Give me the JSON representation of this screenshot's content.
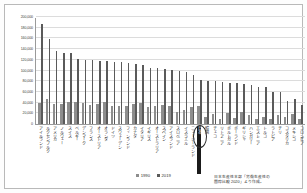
{
  "chart_data": {
    "type": "bar",
    "title": "",
    "subtitle": "",
    "xlabel": "",
    "ylabel": "",
    "ylim": [
      0,
      200000
    ],
    "yticks": [
      "0",
      "20,000",
      "40,000",
      "60,000",
      "80,000",
      "100,000",
      "120,000",
      "140,000",
      "160,000",
      "180,000",
      "200,000"
    ],
    "grid": true,
    "legend_position": "bottom-center",
    "highlight_category": "日本",
    "categories": [
      "アイルランド",
      "ルクセンブルク",
      "アメリカ",
      "ノルウェー",
      "スイス",
      "ベルギー",
      "デンマーク",
      "フランス",
      "オーストリア",
      "オランダ",
      "ドイツ",
      "スウェーデン",
      "フィンランド",
      "カナダ",
      "イタリア",
      "イギリス",
      "オーストラリア",
      "スペイン",
      "アイスランド",
      "スロベニア",
      "イスラエル",
      "ニュージーランド",
      "日本",
      "韓国",
      "チェコ",
      "リトアニア",
      "ポルトガル",
      "ポーランド",
      "ギリシャ",
      "ハンガリー",
      "エストニア",
      "トルコ",
      "ラトビア",
      "チリ",
      "コスタリカ",
      "メキシコ",
      "コロンビア"
    ],
    "series": [
      {
        "name": "1990",
        "color": "#8d8d8d",
        "values": [
          39000,
          47000,
          38000,
          37000,
          42000,
          41000,
          40000,
          36000,
          38000,
          41000,
          34000,
          34000,
          33000,
          37000,
          39000,
          31000,
          34000,
          35000,
          33000,
          22000,
          26000,
          31000,
          34000,
          14000,
          18000,
          10000,
          21000,
          11000,
          22000,
          17000,
          10000,
          14000,
          10000,
          16000,
          14000,
          18000,
          9000
        ]
      },
      {
        "name": "2019",
        "color": "#5a5a5a",
        "values": [
          187000,
          158000,
          136000,
          133000,
          132000,
          121000,
          120000,
          119000,
          118000,
          117000,
          116000,
          115000,
          114000,
          112000,
          111000,
          105000,
          104000,
          103000,
          101000,
          100000,
          98000,
          92000,
          82000,
          81000,
          80000,
          79000,
          77000,
          76000,
          75000,
          72000,
          70000,
          69000,
          59000,
          60000,
          43000,
          47000,
          36000
        ]
      }
    ],
    "annotations": [
      {
        "type": "ellipse",
        "target": "日本",
        "note": "Japan highlighted"
      }
    ]
  },
  "legend": {
    "items": [
      {
        "label": "1990",
        "color": "#8d8d8d"
      },
      {
        "label": "2019",
        "color": "#5a5a5a"
      }
    ]
  },
  "source": {
    "line1": "日本生産性本部「労働生産性の",
    "line2": "国際比較 2020」より作成。"
  }
}
